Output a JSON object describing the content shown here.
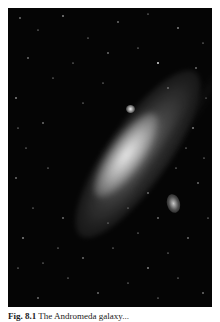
{
  "figure": {
    "background_color": "#050505",
    "caption_label": "Fig. 8.1",
    "caption_text": "The Andromeda galaxy..."
  }
}
